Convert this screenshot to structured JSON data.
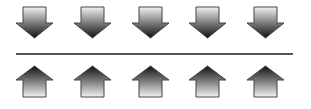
{
  "diagram": {
    "top_row": {
      "direction": "down",
      "count": 5,
      "icon": "down-arrow-icon",
      "centers_x": [
        35,
        93,
        151,
        208,
        266
      ]
    },
    "bottom_row": {
      "direction": "up",
      "count": 5,
      "icon": "up-arrow-icon",
      "centers_x": [
        35,
        93,
        151,
        208,
        266
      ]
    },
    "divider": {
      "color": "#555555"
    },
    "colors": {
      "gradient_light": "#f2f2f2",
      "gradient_dark": "#111111",
      "outline": "#444444",
      "background": "#ffffff"
    }
  }
}
